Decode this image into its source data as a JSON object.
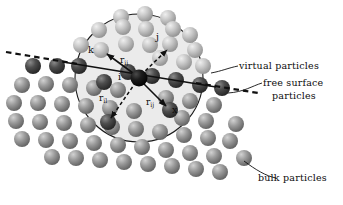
{
  "figure": {
    "type": "diagram"
  },
  "annotations": {
    "virtual": "virtual particles",
    "free_surface_line1": "free surface",
    "free_surface_line2": "particles",
    "bulk": "bulk particles"
  },
  "math_labels": {
    "k": "k",
    "j": "j",
    "i": "i",
    "l": "l",
    "x": "x",
    "r_ij_upper_base": "r",
    "r_ij_upper_sub": "ij",
    "r_il_base": "r",
    "r_il_sub": "il",
    "r_ij_lower_base": "r",
    "r_ij_lower_sub": "ij"
  },
  "colors": {
    "virtual_particle": "#b9b9b9",
    "bulk_particle": "#8f8f8f",
    "free_surface_particle": "#4a4a4a",
    "center_particle": "#151515",
    "support_domain_fill": "#ebebeb",
    "support_domain_stroke": "#1a1a1a",
    "free_surface_dash": "#101010",
    "vector_line": "#101010",
    "text": "#0d0d0d",
    "background": "#ffffff"
  },
  "geometry": {
    "support_domain": {
      "cx": 139,
      "cy": 78,
      "r": 64
    },
    "center_particle": {
      "cx": 139,
      "cy": 78
    },
    "free_surface_slope_deg": 14
  },
  "particles": {
    "virtual": [
      {
        "cx": 121,
        "cy": 17,
        "r": 8
      },
      {
        "cx": 145,
        "cy": 14,
        "r": 8
      },
      {
        "cx": 168,
        "cy": 18,
        "r": 8
      },
      {
        "cx": 99,
        "cy": 30,
        "r": 8
      },
      {
        "cx": 123,
        "cy": 27,
        "r": 8
      },
      {
        "cx": 146,
        "cy": 29,
        "r": 8
      },
      {
        "cx": 170,
        "cy": 31,
        "r": 8
      },
      {
        "cx": 190,
        "cy": 35,
        "r": 8
      },
      {
        "cx": 81,
        "cy": 45,
        "r": 8
      },
      {
        "cx": 103,
        "cy": 43,
        "r": 8
      },
      {
        "cx": 126,
        "cy": 44,
        "r": 8
      },
      {
        "cx": 150,
        "cy": 45,
        "r": 8
      },
      {
        "cx": 173,
        "cy": 47,
        "r": 8
      },
      {
        "cx": 195,
        "cy": 50,
        "r": 8
      },
      {
        "cx": 160,
        "cy": 58,
        "r": 8
      },
      {
        "cx": 184,
        "cy": 62,
        "r": 8
      },
      {
        "cx": 203,
        "cy": 66,
        "r": 8
      }
    ],
    "free_surface": [
      {
        "cx": 33,
        "cy": 66,
        "r": 8
      },
      {
        "cx": 57,
        "cy": 66,
        "r": 8
      },
      {
        "cx": 79,
        "cy": 66,
        "r": 8
      },
      {
        "cx": 104,
        "cy": 70,
        "r": 8
      },
      {
        "cx": 128,
        "cy": 72,
        "r": 8
      },
      {
        "cx": 152,
        "cy": 76,
        "r": 8
      },
      {
        "cx": 176,
        "cy": 80,
        "r": 8
      },
      {
        "cx": 200,
        "cy": 85,
        "r": 8
      },
      {
        "cx": 222,
        "cy": 88,
        "r": 8
      }
    ],
    "bulk": [
      {
        "cx": 22,
        "cy": 85,
        "r": 8
      },
      {
        "cx": 46,
        "cy": 84,
        "r": 8
      },
      {
        "cx": 70,
        "cy": 85,
        "r": 8
      },
      {
        "cx": 94,
        "cy": 88,
        "r": 8
      },
      {
        "cx": 118,
        "cy": 90,
        "r": 8
      },
      {
        "cx": 166,
        "cy": 98,
        "r": 8
      },
      {
        "cx": 190,
        "cy": 101,
        "r": 8
      },
      {
        "cx": 214,
        "cy": 105,
        "r": 8
      },
      {
        "cx": 14,
        "cy": 103,
        "r": 8
      },
      {
        "cx": 38,
        "cy": 103,
        "r": 8
      },
      {
        "cx": 62,
        "cy": 104,
        "r": 8
      },
      {
        "cx": 86,
        "cy": 106,
        "r": 8
      },
      {
        "cx": 110,
        "cy": 108,
        "r": 8
      },
      {
        "cx": 134,
        "cy": 111,
        "r": 8
      },
      {
        "cx": 182,
        "cy": 118,
        "r": 8
      },
      {
        "cx": 206,
        "cy": 121,
        "r": 8
      },
      {
        "cx": 16,
        "cy": 121,
        "r": 8
      },
      {
        "cx": 40,
        "cy": 122,
        "r": 8
      },
      {
        "cx": 64,
        "cy": 123,
        "r": 8
      },
      {
        "cx": 88,
        "cy": 125,
        "r": 8
      },
      {
        "cx": 112,
        "cy": 127,
        "r": 8
      },
      {
        "cx": 136,
        "cy": 129,
        "r": 8
      },
      {
        "cx": 160,
        "cy": 132,
        "r": 8
      },
      {
        "cx": 184,
        "cy": 135,
        "r": 8
      },
      {
        "cx": 208,
        "cy": 138,
        "r": 8
      },
      {
        "cx": 22,
        "cy": 139,
        "r": 8
      },
      {
        "cx": 46,
        "cy": 140,
        "r": 8
      },
      {
        "cx": 70,
        "cy": 141,
        "r": 8
      },
      {
        "cx": 94,
        "cy": 143,
        "r": 8
      },
      {
        "cx": 118,
        "cy": 145,
        "r": 8
      },
      {
        "cx": 142,
        "cy": 147,
        "r": 8
      },
      {
        "cx": 166,
        "cy": 150,
        "r": 8
      },
      {
        "cx": 190,
        "cy": 153,
        "r": 8
      },
      {
        "cx": 214,
        "cy": 156,
        "r": 8
      },
      {
        "cx": 238,
        "cy": 159,
        "r": 8
      },
      {
        "cx": 52,
        "cy": 157,
        "r": 8
      },
      {
        "cx": 76,
        "cy": 158,
        "r": 8
      },
      {
        "cx": 100,
        "cy": 160,
        "r": 8
      },
      {
        "cx": 124,
        "cy": 162,
        "r": 8
      },
      {
        "cx": 148,
        "cy": 164,
        "r": 8
      },
      {
        "cx": 172,
        "cy": 166,
        "r": 8
      },
      {
        "cx": 196,
        "cy": 169,
        "r": 8
      },
      {
        "cx": 220,
        "cy": 172,
        "r": 8
      },
      {
        "cx": 244,
        "cy": 158,
        "r": 8
      },
      {
        "cx": 230,
        "cy": 141,
        "r": 8
      },
      {
        "cx": 236,
        "cy": 124,
        "r": 8
      }
    ],
    "neighbors_in_domain": [
      {
        "cx": 101,
        "cy": 50,
        "r": 8,
        "kind": "virtual",
        "label": "k"
      },
      {
        "cx": 170,
        "cy": 44,
        "r": 8,
        "kind": "virtual",
        "label": "j"
      },
      {
        "cx": 104,
        "cy": 82,
        "r": 8,
        "kind": "free_surface",
        "label": "l-upper"
      },
      {
        "cx": 108,
        "cy": 122,
        "r": 8,
        "kind": "free_surface",
        "label": "l"
      },
      {
        "cx": 170,
        "cy": 110,
        "r": 8,
        "kind": "free_surface",
        "label": "x"
      }
    ]
  },
  "vectors": [
    {
      "name": "i-to-k",
      "x1": 139,
      "y1": 78,
      "x2": 104,
      "y2": 52,
      "style": "solid"
    },
    {
      "name": "i-to-j",
      "x1": 139,
      "y1": 78,
      "x2": 170,
      "y2": 48,
      "style": "dashed"
    },
    {
      "name": "i-to-l",
      "x1": 139,
      "y1": 78,
      "x2": 110,
      "y2": 120,
      "style": "dashed"
    },
    {
      "name": "i-to-x",
      "x1": 139,
      "y1": 78,
      "x2": 168,
      "y2": 108,
      "style": "solid"
    },
    {
      "name": "surface-tangent",
      "x1": 63,
      "y1": 62,
      "x2": 216,
      "y2": 87,
      "style": "solid"
    }
  ]
}
